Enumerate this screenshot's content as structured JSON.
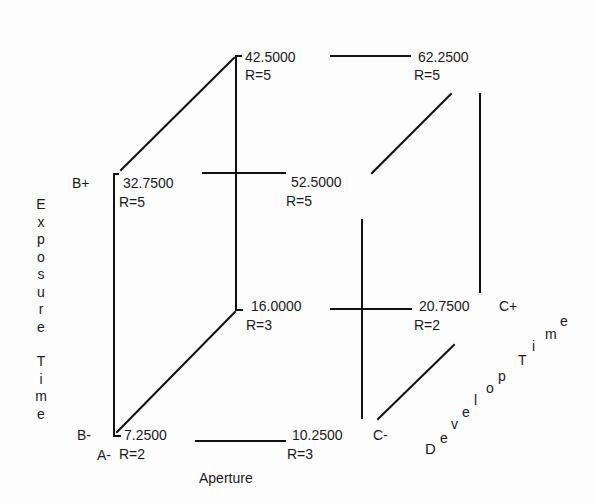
{
  "diagram": {
    "type": "cube-factorial-design",
    "axes": {
      "x": "Aperture",
      "y": "Exposure Time",
      "z": "Develop Time"
    },
    "factor_levels": {
      "a_low": "A-",
      "b_low": "B-",
      "b_high": "B+",
      "c_low": "C-",
      "c_high": "C+"
    },
    "vertices": [
      {
        "id": "a-b-c-",
        "value": "7.2500",
        "r": "R=2"
      },
      {
        "id": "a+b-c-",
        "value": "10.2500",
        "r": "R=3"
      },
      {
        "id": "a-b+c-",
        "value": "32.7500",
        "r": "R=5"
      },
      {
        "id": "a+b+c-",
        "value": "52.5000",
        "r": "R=5"
      },
      {
        "id": "a-b-c+",
        "value": "16.0000",
        "r": "R=3"
      },
      {
        "id": "a+b-c+",
        "value": "20.7500",
        "r": "R=2"
      },
      {
        "id": "a-b+c+",
        "value": "42.5000",
        "r": "R=5"
      },
      {
        "id": "a+b+c+",
        "value": "62.2500",
        "r": "R=5"
      }
    ],
    "y_axis_letters": [
      "E",
      "x",
      "p",
      "o",
      "s",
      "u",
      "r",
      "e",
      "",
      "T",
      "i",
      "m",
      "e"
    ],
    "z_axis_letters": [
      "D",
      "e",
      "v",
      "e",
      "l",
      "o",
      "p",
      "T",
      "i",
      "m",
      "e"
    ]
  }
}
